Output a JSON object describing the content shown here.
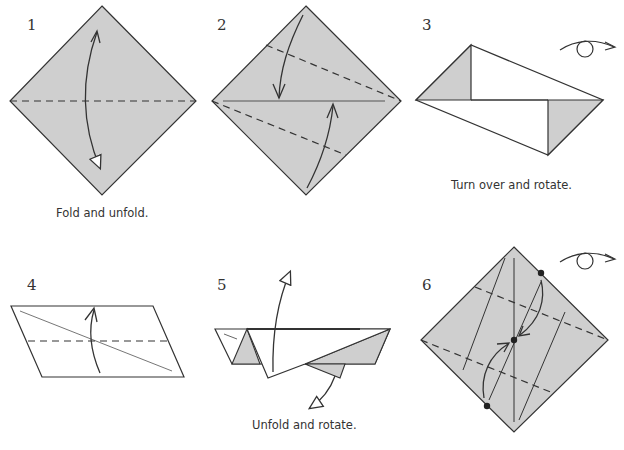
{
  "diagram": {
    "colors": {
      "paper_fill": "#cfcfcf",
      "white_fill": "#ffffff",
      "line": "#333333",
      "text": "#333333"
    },
    "steps": [
      {
        "number": "1",
        "caption": "Fold and unfold."
      },
      {
        "number": "2",
        "caption": ""
      },
      {
        "number": "3",
        "caption": "Turn over and rotate."
      },
      {
        "number": "4",
        "caption": ""
      },
      {
        "number": "5",
        "caption": "Unfold and rotate."
      },
      {
        "number": "6",
        "caption": ""
      }
    ],
    "symbols": {
      "turn_over": "turn-over-icon",
      "valley_fold": "dashed-line",
      "fold_arrow": "curved-arrow",
      "unfold_arrow": "hollow-arrowhead",
      "reference_point": "dot"
    }
  }
}
